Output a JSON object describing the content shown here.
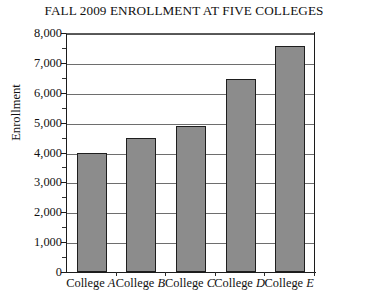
{
  "chart_data": {
    "type": "bar",
    "title": "FALL 2009 ENROLLMENT AT FIVE COLLEGES",
    "xlabel": "",
    "ylabel": "Enrollment",
    "categories": [
      "College A",
      "College B",
      "College C",
      "College D",
      "College E"
    ],
    "category_prefix": "College",
    "category_letters": [
      "A",
      "B",
      "C",
      "D",
      "E"
    ],
    "values": [
      4000,
      4500,
      4900,
      6450,
      7550
    ],
    "ylim": [
      0,
      8000
    ],
    "y_major_step": 1000,
    "y_minor_step": 500,
    "y_tick_labels": [
      "0",
      "1,000",
      "2,000",
      "3,000",
      "4,000",
      "5,000",
      "6,000",
      "7,000",
      "8,000"
    ],
    "y_tick_values": [
      0,
      1000,
      2000,
      3000,
      4000,
      5000,
      6000,
      7000,
      8000
    ],
    "y_minor_tick_values": [
      500,
      1500,
      2500,
      3500,
      4500,
      5500,
      6500,
      7500
    ],
    "grid": true,
    "grid_axis": "y",
    "legend": false,
    "legend_position": "none",
    "bar_color": "#8c8c8c",
    "bar_edge_color": "#1e1e1e",
    "axis_color": "#1c1c1c",
    "grid_color": "#6e6e6e",
    "background_color": "#ffffff",
    "text_color": "#111111"
  }
}
